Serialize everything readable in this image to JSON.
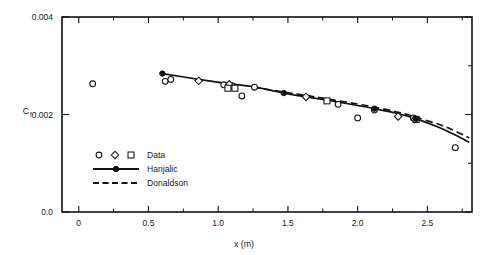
{
  "chart_data": {
    "type": "scatter",
    "title": "",
    "xlabel": "x (m)",
    "ylabel": "Cf",
    "ylabel_base": "C",
    "ylabel_sub": "f",
    "xlim": [
      -0.12,
      2.82
    ],
    "ylim": [
      0.0,
      0.004
    ],
    "grid": false,
    "legend_position": "lower-left-inside",
    "xticks": [
      0,
      0.5,
      1.0,
      1.5,
      2.0,
      2.5
    ],
    "xticklabels": [
      "0",
      "0.5",
      "1.0",
      "1.5",
      "2.0",
      "2.5"
    ],
    "xminorticks": [
      0.25,
      0.75,
      1.25,
      1.75,
      2.25,
      2.75
    ],
    "yticks": [
      0.0,
      0.002,
      0.004
    ],
    "yticklabels": [
      "0.0",
      "0.002",
      "0.004"
    ],
    "legend": [
      {
        "label": "Data",
        "style": "markers",
        "markers": [
          "circle",
          "diamond",
          "square"
        ]
      },
      {
        "label": "Hanjalic",
        "style": "solid-line-with-filled-circle"
      },
      {
        "label": "Donaldson",
        "style": "dashed-line"
      }
    ],
    "series": [
      {
        "name": "Data",
        "marker": "circle-open",
        "points": [
          {
            "x": 0.1,
            "y": 0.00263
          },
          {
            "x": 0.62,
            "y": 0.00268
          },
          {
            "x": 0.66,
            "y": 0.00272
          },
          {
            "x": 1.04,
            "y": 0.00261
          },
          {
            "x": 1.1,
            "y": 0.00259
          },
          {
            "x": 1.17,
            "y": 0.00238
          },
          {
            "x": 1.26,
            "y": 0.00256
          },
          {
            "x": 1.86,
            "y": 0.00221
          },
          {
            "x": 2.0,
            "y": 0.00193
          },
          {
            "x": 2.12,
            "y": 0.00209
          },
          {
            "x": 2.4,
            "y": 0.00193
          },
          {
            "x": 2.7,
            "y": 0.00132
          }
        ]
      },
      {
        "name": "Data",
        "marker": "diamond-open",
        "points": [
          {
            "x": 0.86,
            "y": 0.00269
          },
          {
            "x": 1.08,
            "y": 0.00262
          },
          {
            "x": 1.63,
            "y": 0.00236
          },
          {
            "x": 2.29,
            "y": 0.00196
          },
          {
            "x": 2.41,
            "y": 0.0019
          }
        ]
      },
      {
        "name": "Data",
        "marker": "square-open",
        "points": [
          {
            "x": 1.07,
            "y": 0.00254
          },
          {
            "x": 1.12,
            "y": 0.00254
          },
          {
            "x": 1.78,
            "y": 0.00228
          },
          {
            "x": 2.42,
            "y": 0.0019
          }
        ]
      },
      {
        "name": "Hanjalic",
        "style": "solid",
        "marker": "circle-filled",
        "marker_points": [
          {
            "x": 0.6,
            "y": 0.00284
          },
          {
            "x": 1.47,
            "y": 0.00244
          },
          {
            "x": 2.12,
            "y": 0.00212
          },
          {
            "x": 2.42,
            "y": 0.00191
          }
        ],
        "curve": [
          {
            "x": 0.6,
            "y": 0.00284
          },
          {
            "x": 0.86,
            "y": 0.00272
          },
          {
            "x": 1.08,
            "y": 0.00263
          },
          {
            "x": 1.25,
            "y": 0.00257
          },
          {
            "x": 1.47,
            "y": 0.00244
          },
          {
            "x": 1.7,
            "y": 0.00233
          },
          {
            "x": 1.95,
            "y": 0.00221
          },
          {
            "x": 2.12,
            "y": 0.00212
          },
          {
            "x": 2.3,
            "y": 0.00201
          },
          {
            "x": 2.42,
            "y": 0.00191
          },
          {
            "x": 2.58,
            "y": 0.00174
          },
          {
            "x": 2.7,
            "y": 0.00158
          },
          {
            "x": 2.8,
            "y": 0.00143
          }
        ]
      },
      {
        "name": "Donaldson",
        "style": "dashed",
        "curve": [
          {
            "x": 1.25,
            "y": 0.00256
          },
          {
            "x": 1.47,
            "y": 0.00246
          },
          {
            "x": 1.63,
            "y": 0.00239
          },
          {
            "x": 1.78,
            "y": 0.00232
          },
          {
            "x": 1.95,
            "y": 0.00224
          },
          {
            "x": 2.12,
            "y": 0.00215
          },
          {
            "x": 2.3,
            "y": 0.00204
          },
          {
            "x": 2.42,
            "y": 0.00194
          },
          {
            "x": 2.58,
            "y": 0.0018
          },
          {
            "x": 2.7,
            "y": 0.00166
          },
          {
            "x": 2.8,
            "y": 0.00152
          }
        ]
      }
    ]
  }
}
